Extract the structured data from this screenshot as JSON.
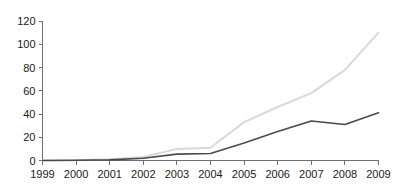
{
  "chart_data": {
    "type": "line",
    "title": "",
    "subtitle": "",
    "xlabel": "",
    "ylabel": "",
    "categories": [
      "1999",
      "2000",
      "2001",
      "2002",
      "2003",
      "2004",
      "2005",
      "2006",
      "2007",
      "2008",
      "2009"
    ],
    "x": [
      1999,
      2000,
      2001,
      2002,
      2003,
      2004,
      2005,
      2006,
      2007,
      2008,
      2009
    ],
    "series": [
      {
        "name": "light-gray-series",
        "color": "#d9d9d9",
        "values": [
          0,
          0.3,
          1,
          3,
          10,
          11,
          33,
          46,
          58,
          78,
          110
        ]
      },
      {
        "name": "dark-gray-series",
        "color": "#4a4a4a",
        "values": [
          0,
          0.2,
          0.5,
          2,
          5.5,
          6,
          15,
          25,
          34,
          31,
          41
        ]
      }
    ],
    "ylim": [
      0,
      120
    ],
    "yticks": [
      0,
      20,
      40,
      60,
      80,
      100,
      120
    ],
    "ytick_labels": [
      "0",
      "20",
      "40",
      "60",
      "80",
      "100",
      "120"
    ],
    "xtick_labels": [
      "1999",
      "2000",
      "2001",
      "2002",
      "2003",
      "2004",
      "2005",
      "2006",
      "2007",
      "2008",
      "2009"
    ],
    "grid": false,
    "legend": "none",
    "annotations": []
  },
  "axes": {
    "y_axis_color": "#6e6e6e",
    "x_axis_color": "#6e6e6e"
  }
}
